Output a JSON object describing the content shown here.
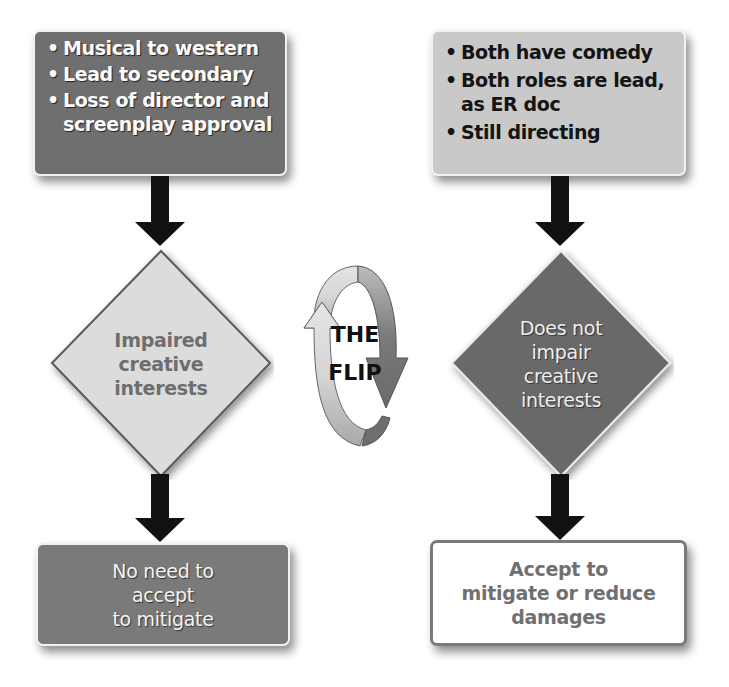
{
  "diagram": {
    "left_branch": {
      "top_box": {
        "bullets": [
          "Musical to western",
          "Lead to secondary",
          "Loss of director and screenplay approval"
        ],
        "fill": "#6f6f6f",
        "text_color": "#ffffff"
      },
      "decision": {
        "lines": [
          "Impaired",
          "creative",
          "interests"
        ],
        "fill": "#dcdcdc",
        "text_color": "#707070"
      },
      "outcome": {
        "lines": [
          "No need to",
          "accept",
          "to mitigate"
        ],
        "fill": "#7a7a7a",
        "text_color": "#ffffff"
      }
    },
    "center": {
      "label_line1": "THE",
      "label_line2": "FLIP",
      "icon": "cycle-arrows-icon"
    },
    "right_branch": {
      "top_box": {
        "bullets": [
          "Both have comedy",
          "Both roles are lead, as ER doc",
          "Still directing"
        ],
        "fill": "#c9c9c9",
        "text_color": "#141414"
      },
      "decision": {
        "lines": [
          "Does not",
          "impair",
          "creative",
          "interests"
        ],
        "fill": "#6a6a6a",
        "text_color": "#f0f0f0"
      },
      "outcome": {
        "lines": [
          "Accept to",
          "mitigate or reduce",
          "damages"
        ],
        "fill": "#ffffff",
        "border": "#7a7a7a",
        "text_color": "#707070"
      }
    },
    "connector_color": "#111111"
  }
}
